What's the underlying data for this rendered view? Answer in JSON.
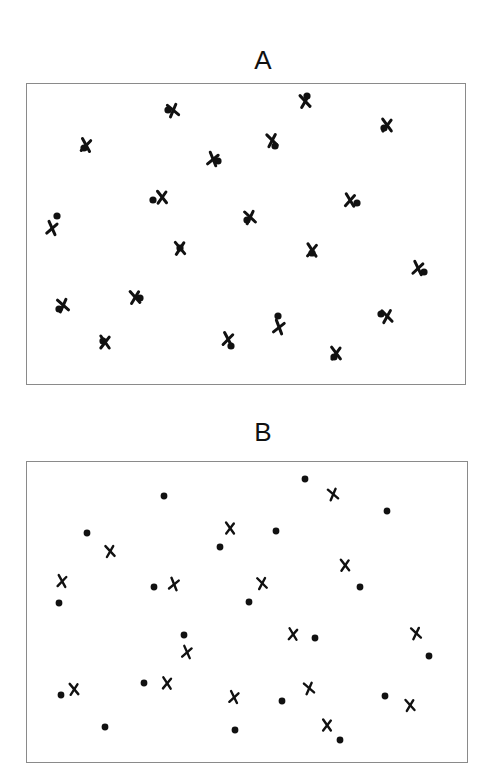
{
  "panels": [
    {
      "label": "A",
      "label_pos": [
        263,
        60
      ],
      "frame": {
        "x": 26,
        "y": 83,
        "w": 440,
        "h": 302
      },
      "description": "Dots and crosses largely overlapping / paired",
      "dots": [
        [
          168,
          110
        ],
        [
          307,
          96
        ],
        [
          384,
          128
        ],
        [
          84,
          148
        ],
        [
          218,
          161
        ],
        [
          275,
          146
        ],
        [
          153,
          200
        ],
        [
          357,
          203
        ],
        [
          57,
          216
        ],
        [
          247,
          220
        ],
        [
          180,
          248
        ],
        [
          312,
          253
        ],
        [
          424,
          272
        ],
        [
          59,
          309
        ],
        [
          140,
          298
        ],
        [
          103,
          341
        ],
        [
          231,
          346
        ],
        [
          278,
          316
        ],
        [
          381,
          314
        ],
        [
          334,
          357
        ]
      ],
      "crosses": [
        [
          173,
          110
        ],
        [
          305,
          101
        ],
        [
          387,
          125
        ],
        [
          86,
          145
        ],
        [
          213,
          159
        ],
        [
          272,
          140
        ],
        [
          162,
          197
        ],
        [
          350,
          200
        ],
        [
          52,
          228
        ],
        [
          250,
          217
        ],
        [
          180,
          248
        ],
        [
          312,
          250
        ],
        [
          418,
          268
        ],
        [
          63,
          305
        ],
        [
          135,
          297
        ],
        [
          105,
          342
        ],
        [
          228,
          339
        ],
        [
          279,
          327
        ],
        [
          387,
          316
        ],
        [
          336,
          353
        ]
      ]
    },
    {
      "label": "B",
      "label_pos": [
        263,
        432
      ],
      "frame": {
        "x": 26,
        "y": 461,
        "w": 442,
        "h": 302
      },
      "description": "Dots and crosses spatially independent",
      "dots": [
        [
          164,
          496
        ],
        [
          305,
          479
        ],
        [
          387,
          511
        ],
        [
          87,
          533
        ],
        [
          220,
          547
        ],
        [
          276,
          531
        ],
        [
          59,
          603
        ],
        [
          154,
          587
        ],
        [
          249,
          602
        ],
        [
          360,
          587
        ],
        [
          184,
          635
        ],
        [
          315,
          638
        ],
        [
          429,
          656
        ],
        [
          61,
          695
        ],
        [
          144,
          683
        ],
        [
          282,
          701
        ],
        [
          385,
          696
        ],
        [
          105,
          727
        ],
        [
          235,
          730
        ],
        [
          340,
          740
        ]
      ],
      "crosses": [
        [
          333,
          494
        ],
        [
          110,
          551
        ],
        [
          230,
          528
        ],
        [
          62,
          581
        ],
        [
          174,
          584
        ],
        [
          262,
          583
        ],
        [
          345,
          565
        ],
        [
          293,
          634
        ],
        [
          187,
          652
        ],
        [
          416,
          633
        ],
        [
          74,
          689
        ],
        [
          167,
          683
        ],
        [
          234,
          697
        ],
        [
          309,
          688
        ],
        [
          410,
          705
        ],
        [
          327,
          725
        ]
      ]
    }
  ],
  "colors": {
    "marker": "#111111",
    "frame": "#8a8a8a",
    "background": "#ffffff"
  }
}
